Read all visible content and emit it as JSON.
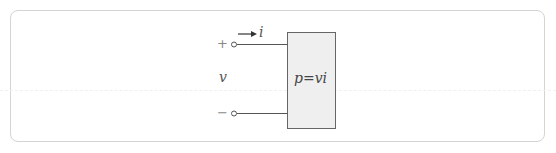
{
  "diagram": {
    "terminal_plus": "+",
    "terminal_minus": "−",
    "voltage_label": "v",
    "current_label": "i",
    "element_label": "p=vi"
  },
  "colors": {
    "wire": "#555555",
    "box_fill": "#efefef",
    "box_border": "#666666",
    "frame_border": "#d4d4d4"
  }
}
